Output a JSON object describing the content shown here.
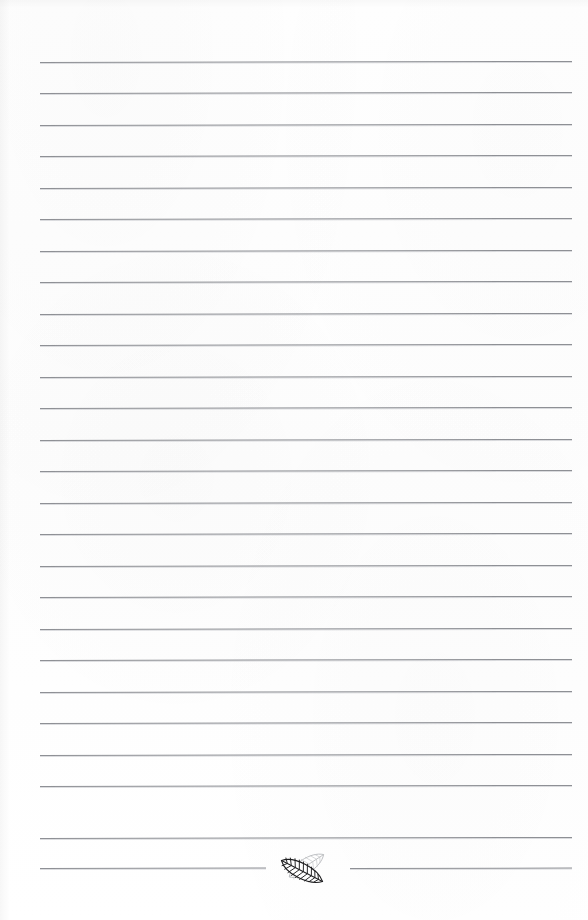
{
  "page": {
    "kind": "lined-notepad-page",
    "width": 588,
    "height": 920,
    "background_color": "#fefefe",
    "has_text_content": false,
    "note_lines_written": []
  },
  "rules": {
    "count": 26,
    "color": "#8e9095",
    "halo_color": "#bec0c4",
    "thickness_px": 1,
    "left_x": 40,
    "right_x": 572,
    "first_y": 62,
    "spacing_y": 31.5,
    "skew_deg": -0.12,
    "items": [
      {
        "index": 0,
        "y": 62,
        "x1": 40,
        "x2": 572,
        "split": false
      },
      {
        "index": 1,
        "y": 93,
        "x1": 40,
        "x2": 572,
        "split": false
      },
      {
        "index": 2,
        "y": 125,
        "x1": 40,
        "x2": 572,
        "split": false
      },
      {
        "index": 3,
        "y": 156,
        "x1": 40,
        "x2": 572,
        "split": false
      },
      {
        "index": 4,
        "y": 188,
        "x1": 40,
        "x2": 572,
        "split": false
      },
      {
        "index": 5,
        "y": 219,
        "x1": 40,
        "x2": 572,
        "split": false
      },
      {
        "index": 6,
        "y": 251,
        "x1": 40,
        "x2": 572,
        "split": false
      },
      {
        "index": 7,
        "y": 282,
        "x1": 40,
        "x2": 572,
        "split": false
      },
      {
        "index": 8,
        "y": 314,
        "x1": 40,
        "x2": 572,
        "split": false
      },
      {
        "index": 9,
        "y": 345,
        "x1": 40,
        "x2": 572,
        "split": false
      },
      {
        "index": 10,
        "y": 377,
        "x1": 40,
        "x2": 572,
        "split": false
      },
      {
        "index": 11,
        "y": 408,
        "x1": 40,
        "x2": 572,
        "split": false
      },
      {
        "index": 12,
        "y": 440,
        "x1": 40,
        "x2": 572,
        "split": false
      },
      {
        "index": 13,
        "y": 471,
        "x1": 40,
        "x2": 572,
        "split": false
      },
      {
        "index": 14,
        "y": 503,
        "x1": 40,
        "x2": 572,
        "split": false
      },
      {
        "index": 15,
        "y": 534,
        "x1": 40,
        "x2": 572,
        "split": false
      },
      {
        "index": 16,
        "y": 566,
        "x1": 40,
        "x2": 572,
        "split": false
      },
      {
        "index": 17,
        "y": 597,
        "x1": 40,
        "x2": 572,
        "split": false
      },
      {
        "index": 18,
        "y": 629,
        "x1": 40,
        "x2": 572,
        "split": false
      },
      {
        "index": 19,
        "y": 660,
        "x1": 40,
        "x2": 572,
        "split": false
      },
      {
        "index": 20,
        "y": 692,
        "x1": 40,
        "x2": 572,
        "split": false
      },
      {
        "index": 21,
        "y": 723,
        "x1": 40,
        "x2": 572,
        "split": false
      },
      {
        "index": 22,
        "y": 755,
        "x1": 40,
        "x2": 572,
        "split": false
      },
      {
        "index": 23,
        "y": 786,
        "x1": 40,
        "x2": 572,
        "split": false
      },
      {
        "index": 24,
        "y": 838,
        "x1": 40,
        "x2": 572,
        "split": false
      },
      {
        "index": 25,
        "y": 868,
        "x1": 40,
        "x2": 572,
        "split": true,
        "gap_x1": 266,
        "gap_x2": 350
      }
    ]
  },
  "ornament": {
    "name": "leaf-pair",
    "description": "two overlapping veined leaves centered on the final rule",
    "center_x": 306,
    "center_y": 866,
    "front_leaf": {
      "label": "dark-leaf",
      "stroke_color": "#1d1d1f",
      "fill_color": "#ffffff",
      "rotation_deg": 28,
      "vein_count": 9
    },
    "back_leaf": {
      "label": "light-leaf",
      "stroke_color": "#b9bbbe",
      "fill_color": "#ffffff",
      "rotation_deg": -32,
      "vein_count": 9
    }
  }
}
